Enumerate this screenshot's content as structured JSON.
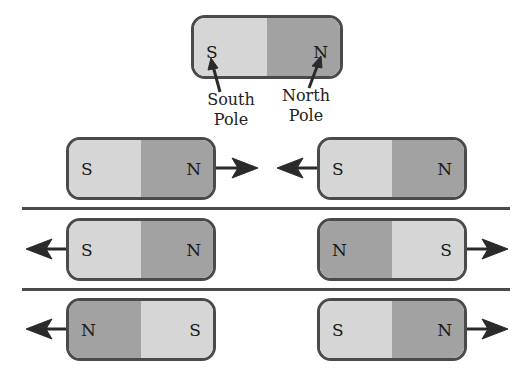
{
  "diagram": {
    "title_magnet": {
      "left_pole": "S",
      "right_pole": "N",
      "labels": {
        "south": "South\nPole",
        "north": "North\nPole",
        "south_line1": "South",
        "south_line2": "Pole",
        "north_line1": "North",
        "north_line2": "Pole"
      }
    },
    "rows": [
      {
        "left_magnet": {
          "poles": [
            "S",
            "N"
          ],
          "arrow": "right"
        },
        "right_magnet": {
          "poles": [
            "S",
            "N"
          ],
          "arrow": "left"
        }
      },
      {
        "left_magnet": {
          "poles": [
            "S",
            "N"
          ],
          "arrow": "left"
        },
        "right_magnet": {
          "poles": [
            "N",
            "S"
          ],
          "arrow": "right"
        }
      },
      {
        "left_magnet": {
          "poles": [
            "N",
            "S"
          ],
          "arrow": "left"
        },
        "right_magnet": {
          "poles": [
            "S",
            "N"
          ],
          "arrow": "right"
        }
      }
    ],
    "colors": {
      "south": "#d6d6d6",
      "north": "#a2a2a2",
      "outline": "#4a4a4a"
    }
  }
}
